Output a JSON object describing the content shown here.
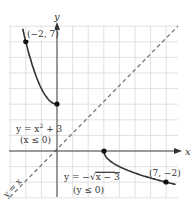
{
  "figure": {
    "axes": {
      "x_label": "x",
      "y_label": "y"
    },
    "curves": [
      {
        "name": "upper-left",
        "equation": "y = x² + 3",
        "equation_base": "y = x",
        "equation_exp": "2",
        "equation_tail": " + 3",
        "domain": "(x ≤ 0)"
      },
      {
        "name": "lower-right",
        "equation": "y = −√x − 3",
        "equation_pre": "y = −",
        "equation_rad": "x − 3",
        "domain": "(y ≤ 0)"
      }
    ],
    "line": {
      "label": "y = x"
    },
    "points": [
      {
        "label": "(−2, 7)"
      },
      {
        "label": "(7, −2)"
      }
    ],
    "colors": {
      "curve": "#333333",
      "grid": "#d6d6d6",
      "axis": "#444444",
      "dashed": "#777777"
    }
  }
}
